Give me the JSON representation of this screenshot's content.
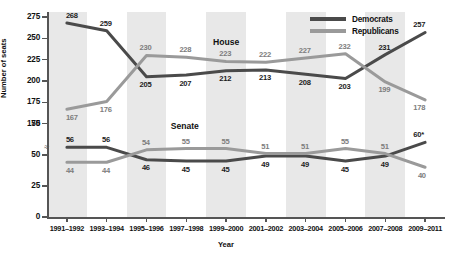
{
  "chart_data": {
    "type": "line",
    "title": "",
    "xlabel": "Year",
    "ylabel": "Number of seats",
    "categories": [
      "1991–1992",
      "1993–1994",
      "1995–1996",
      "1997–1998",
      "1999–2000",
      "2001–2002",
      "2003–2004",
      "2005–2006",
      "2007–2008",
      "2009–2011"
    ],
    "yticks": [
      "0",
      "25",
      "50",
      "75",
      "150",
      "175",
      "200",
      "225",
      "250",
      "275"
    ],
    "ylim": [
      0,
      281
    ],
    "axis_break": true,
    "axis_break_between": [
      75,
      150
    ],
    "grid": false,
    "band_shading": true,
    "legend_position": "top-right",
    "series": [
      {
        "name": "Democrats",
        "color": "#4a4a4a",
        "chamber_groups": [
          {
            "group": "House",
            "values": [
              268,
              259,
              205,
              207,
              212,
              213,
              208,
              203,
              231,
              257
            ],
            "labels": [
              "268",
              "259",
              "205",
              "207",
              "212",
              "213",
              "208",
              "203",
              "231",
              "257"
            ]
          },
          {
            "group": "Senate",
            "values": [
              56,
              56,
              46,
              45,
              45,
              49,
              49,
              45,
              49,
              60
            ],
            "labels": [
              "56",
              "56",
              "46",
              "45",
              "45",
              "49",
              "49",
              "45",
              "49",
              "60*"
            ]
          }
        ]
      },
      {
        "name": "Republicans",
        "color": "#9a9a9a",
        "chamber_groups": [
          {
            "group": "House",
            "values": [
              167,
              176,
              230,
              228,
              223,
              222,
              227,
              232,
              199,
              178
            ],
            "labels": [
              "167",
              "176",
              "230",
              "228",
              "223",
              "222",
              "227",
              "232",
              "199",
              "178"
            ]
          },
          {
            "group": "Senate",
            "values": [
              44,
              44,
              54,
              55,
              55,
              51,
              51,
              55,
              51,
              40
            ],
            "labels": [
              "44",
              "44",
              "54",
              "55",
              "55",
              "51",
              "51",
              "55",
              "51",
              "40"
            ]
          }
        ]
      }
    ],
    "annotations": [
      {
        "text": "House",
        "x_index": 4,
        "y": 245
      },
      {
        "text": "Senate",
        "x_index": 3,
        "y": 72
      }
    ]
  },
  "legend": {
    "items": [
      {
        "label": "Democrats",
        "color": "#4a4a4a"
      },
      {
        "label": "Republicans",
        "color": "#9a9a9a"
      }
    ]
  }
}
